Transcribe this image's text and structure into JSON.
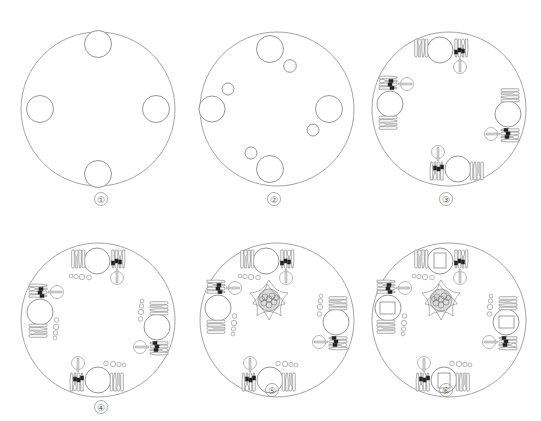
{
  "figure": {
    "panels": [
      {
        "label": "①",
        "step": 1,
        "cx": 98,
        "cy": 109,
        "r": 77,
        "elements": [
          "4 seat positions"
        ]
      },
      {
        "label": "②",
        "step": 2,
        "cx": 277,
        "cy": 109,
        "r": 77,
        "elements": [
          "4 dinner plates",
          "4 bread plates"
        ]
      },
      {
        "label": "③",
        "step": 3,
        "cx": 449,
        "cy": 109,
        "r": 77,
        "elements": [
          "plates",
          "knives & forks",
          "coffee cups",
          "napkin markers"
        ]
      },
      {
        "label": "④",
        "step": 4,
        "cx": 98,
        "cy": 320,
        "r": 77,
        "elements": [
          "plates",
          "cutlery",
          "cups",
          "glassware row"
        ]
      },
      {
        "label": "⑤",
        "step": 5,
        "cx": 277,
        "cy": 320,
        "r": 77,
        "elements": [
          "plates",
          "cutlery",
          "cups",
          "glassware",
          "centerpiece flower"
        ]
      },
      {
        "label": "⑥",
        "step": 6,
        "cx": 449,
        "cy": 320,
        "r": 77,
        "elements": [
          "plates",
          "napkins on plates",
          "cutlery",
          "cups",
          "glassware",
          "centerpiece flower"
        ]
      }
    ]
  },
  "labels": {
    "p1": "①",
    "p2": "②",
    "p3": "③",
    "p4": "④",
    "p5": "⑤",
    "p6": "⑥"
  },
  "colors": {
    "line": "#8a8a8a",
    "dark_block": "#222222",
    "background": "#ffffff"
  }
}
